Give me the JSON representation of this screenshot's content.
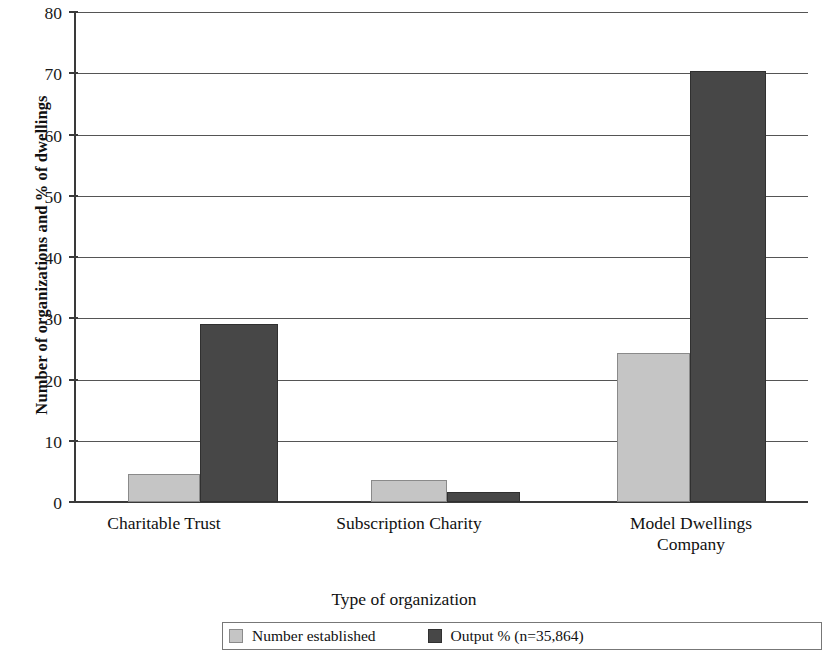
{
  "chart_data": {
    "type": "bar",
    "title": "",
    "xlabel": "Type of organization",
    "ylabel": "Number of organizations and % of dwellings",
    "categories": [
      "Charitable Trust",
      "Subscription Charity",
      "Model Dwellings Company"
    ],
    "category_lines": [
      [
        "Charitable Trust"
      ],
      [
        "Subscription Charity"
      ],
      [
        "Model Dwellings",
        "Company"
      ]
    ],
    "series": [
      {
        "name": "Number established",
        "color": "#c5c5c5",
        "values": [
          4.6,
          3.6,
          24.4
        ]
      },
      {
        "name": "Output % (n=35,864)",
        "color": "#474747",
        "values": [
          29.0,
          1.7,
          70.3
        ]
      }
    ],
    "ylim": [
      0,
      80
    ],
    "yticks": [
      0,
      10,
      20,
      30,
      40,
      50,
      60,
      70,
      80
    ],
    "ytick_labels": [
      "0",
      "10",
      "20",
      "30",
      "40",
      "50",
      "60",
      "70",
      "80"
    ],
    "grid": true,
    "grid_axis": "y",
    "legend_position": "bottom",
    "legend_entries": [
      "Number established",
      "Output % (n=35,864)"
    ]
  },
  "axis": {
    "y_title": "Number of organizations and % of dwellings",
    "x_title": "Type of organization"
  }
}
